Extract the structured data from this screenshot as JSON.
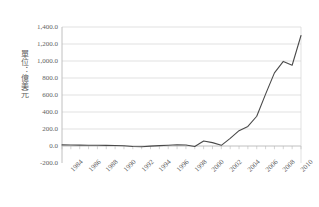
{
  "chart_data": {
    "type": "line",
    "title": "",
    "subtitle": "",
    "xlabel": "",
    "ylabel": "單位：億美元",
    "ylim": [
      -200,
      1400
    ],
    "y_ticks": [
      -200,
      0,
      200,
      400,
      600,
      800,
      1000,
      1200,
      1400
    ],
    "y_tick_labels": [
      "-200.0",
      "0.0",
      "200.0",
      "400.0",
      "600.0",
      "800.0",
      "1,000.0",
      "1,200.0",
      "1,400.0"
    ],
    "x_tick_labels": [
      "1984",
      "1986",
      "1988",
      "1990",
      "1992",
      "1994",
      "1996",
      "1998",
      "2000",
      "2002",
      "2004",
      "2006",
      "2008",
      "2010"
    ],
    "xlim": [
      1983,
      2010
    ],
    "grid": "horizontal",
    "legend": "none",
    "series": [
      {
        "name": "series-1",
        "color": "#4a4a4a",
        "x": [
          1983,
          1984,
          1985,
          1986,
          1987,
          1988,
          1989,
          1990,
          1991,
          1992,
          1993,
          1994,
          1995,
          1996,
          1997,
          1998,
          1999,
          2000,
          2001,
          2002,
          2003,
          2004,
          2005,
          2006,
          2007,
          2008,
          2009,
          2010
        ],
        "values": [
          13,
          12,
          10,
          9,
          8,
          7,
          5,
          3,
          -5,
          -8,
          -2,
          4,
          9,
          14,
          12,
          -6,
          58,
          40,
          8,
          90,
          180,
          230,
          350,
          610,
          860,
          995,
          950,
          1300
        ]
      }
    ]
  },
  "axis": {
    "y_title": "單位：億美元"
  },
  "colors": {
    "line": "#4a4a4a",
    "grid": "#d4d4d4",
    "frame": "#b9b9b9",
    "text": "#5f5f5f",
    "background": "#ffffff"
  }
}
